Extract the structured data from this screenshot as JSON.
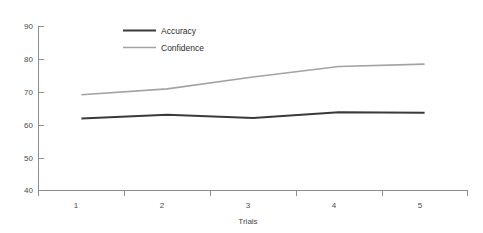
{
  "chart_data": {
    "type": "line",
    "title": "",
    "xlabel": "Trials",
    "ylabel": "",
    "categories": [
      "1",
      "2",
      "3",
      "4",
      "5"
    ],
    "x": [
      1,
      2,
      3,
      4,
      5
    ],
    "ylim": [
      40,
      90
    ],
    "xlim": [
      0.5,
      5.5
    ],
    "yticks": [
      40,
      50,
      60,
      70,
      80,
      90
    ],
    "ytick_labels": [
      "40",
      "50",
      "60",
      "70",
      "80",
      "90"
    ],
    "xtick_labels": [
      "1",
      "2",
      "3",
      "4",
      "5"
    ],
    "grid": false,
    "legend_position": "top-center",
    "series": [
      {
        "name": "Accuracy",
        "color": "#3a3a3a",
        "width": 2.0,
        "values": [
          61.9,
          63.0,
          62.0,
          63.8,
          63.6
        ]
      },
      {
        "name": "Confidence",
        "color": "#a3a3a3",
        "width": 1.6,
        "values": [
          69.1,
          70.9,
          74.5,
          77.7,
          78.4
        ]
      }
    ]
  },
  "axes": {
    "y_tick_labels": [
      "90",
      "80",
      "70",
      "60",
      "50",
      "40"
    ],
    "x_tick_labels": [
      "1",
      "2",
      "3",
      "4",
      "5"
    ],
    "x_axis_title": "Trials"
  },
  "legend": {
    "items": [
      {
        "label": "Accuracy",
        "color": "#3a3a3a"
      },
      {
        "label": "Confidence",
        "color": "#a3a3a3"
      }
    ]
  },
  "colors": {
    "accuracy": "#3a3a3a",
    "confidence": "#a3a3a3",
    "axis": "#8d8d8d",
    "text": "#4a4a4a",
    "background": "#ffffff"
  }
}
